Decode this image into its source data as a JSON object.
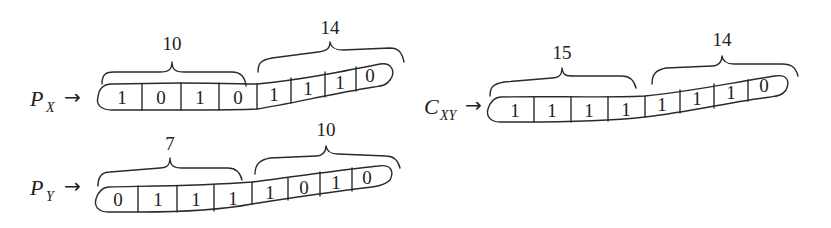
{
  "registers": [
    {
      "id": "px",
      "label_main": "P",
      "label_sub": "X",
      "arrow": "→",
      "bits": [
        "1",
        "0",
        "1",
        "0",
        "1",
        "1",
        "1",
        "0"
      ],
      "groups": [
        {
          "count": "10",
          "bits": [
            "1",
            "0",
            "1",
            "0"
          ]
        },
        {
          "count": "14",
          "bits": [
            "1",
            "1",
            "1",
            "0"
          ]
        }
      ]
    },
    {
      "id": "py",
      "label_main": "P",
      "label_sub": "Y",
      "arrow": "→",
      "bits": [
        "0",
        "1",
        "1",
        "1",
        "1",
        "0",
        "1",
        "0"
      ],
      "groups": [
        {
          "count": "7",
          "bits": [
            "0",
            "1",
            "1",
            "1"
          ]
        },
        {
          "count": "10",
          "bits": [
            "1",
            "0",
            "1",
            "0"
          ]
        }
      ]
    },
    {
      "id": "cxy",
      "label_main": "C",
      "label_sub": "XY",
      "arrow": "→",
      "bits": [
        "1",
        "1",
        "1",
        "1",
        "1",
        "1",
        "1",
        "0"
      ],
      "groups": [
        {
          "count": "15",
          "bits": [
            "1",
            "1",
            "1",
            "1"
          ]
        },
        {
          "count": "14",
          "bits": [
            "1",
            "1",
            "1",
            "0"
          ]
        }
      ]
    }
  ]
}
